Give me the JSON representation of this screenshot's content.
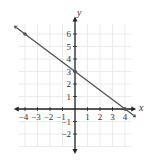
{
  "chart_data": {
    "type": "line",
    "title": "",
    "xlabel": "x",
    "ylabel": "y",
    "xlim": [
      -4.5,
      4.5
    ],
    "ylim": [
      -3,
      7
    ],
    "grid": true,
    "x_ticks": [
      "-4",
      "-3",
      "-2",
      "-1",
      "1",
      "2",
      "3",
      "4"
    ],
    "y_ticks": [
      "-2",
      "-1",
      "1",
      "2",
      "3",
      "4",
      "5",
      "6"
    ],
    "series": [
      {
        "name": "line",
        "equation": "y = -3/4 x + 3",
        "points": [
          [
            -4,
            6
          ],
          [
            0,
            3
          ],
          [
            4,
            0
          ]
        ],
        "color": "#555555"
      }
    ]
  },
  "labels": {
    "x": "x",
    "y": "y"
  }
}
